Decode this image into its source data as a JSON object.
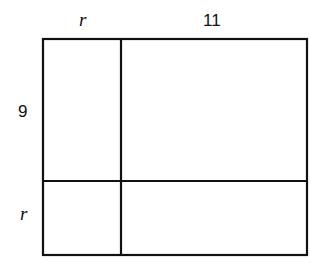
{
  "diagram": {
    "type": "area-model-rectangle",
    "labels": {
      "top_left": "r",
      "top_right": "11",
      "left_top": "9",
      "left_bottom": "r"
    },
    "regions": [
      {
        "id": "top-left",
        "width": "r",
        "height": "9"
      },
      {
        "id": "top-right",
        "width": "11",
        "height": "9"
      },
      {
        "id": "bottom-left",
        "width": "r",
        "height": "r"
      },
      {
        "id": "bottom-right",
        "width": "11",
        "height": "r"
      }
    ],
    "stroke_color": "#111111",
    "background": "#ffffff"
  }
}
